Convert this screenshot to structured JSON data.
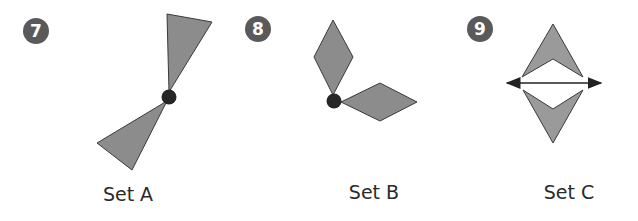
{
  "problems": [
    {
      "number": "7",
      "label": "Set A",
      "transformation_marker": "rotation-center-point"
    },
    {
      "number": "8",
      "label": "Set B",
      "transformation_marker": "rotation-center-point"
    },
    {
      "number": "9",
      "label": "Set C",
      "transformation_marker": "line-of-reflection"
    }
  ],
  "colors": {
    "shape_fill": "#8c8c8c",
    "shape_stroke": "#3a3a3a",
    "badge": "#5a5a5a",
    "point": "#262626"
  }
}
